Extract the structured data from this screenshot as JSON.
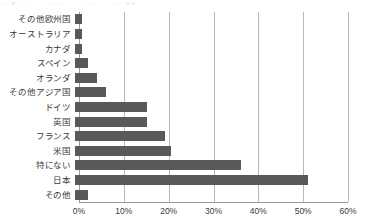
{
  "top_artifact": {
    "text": "— ■ — · · —— · · ——  ·  ——■■"
  },
  "chart_data": {
    "type": "bar",
    "orientation": "horizontal",
    "title": "",
    "subtitle": "",
    "xlabel": "",
    "ylabel": "",
    "xlim": [
      0,
      60
    ],
    "xtick_step": 10,
    "grid": true,
    "legend": false,
    "bar_color": "#595959",
    "gridline_color": "#b9b9b9",
    "axis_color": "#9a9a9a",
    "xtick_labels": [
      "0%",
      "10%",
      "20%",
      "30%",
      "40%",
      "50%",
      "60%"
    ],
    "xtick_values": [
      0,
      10,
      20,
      30,
      40,
      50,
      60
    ],
    "categories": [
      "その他欧州国",
      "オーストラリア",
      "カナダ",
      "スペイン",
      "オランダ",
      "その他アジア国",
      "ドイツ",
      "英国",
      "フランス",
      "米国",
      "特にない",
      "日本",
      "その他"
    ],
    "values": [
      1.5,
      1.5,
      1.5,
      3.0,
      5.0,
      7.0,
      16.0,
      16.0,
      20.0,
      21.5,
      37.0,
      52.0,
      3.0
    ]
  }
}
